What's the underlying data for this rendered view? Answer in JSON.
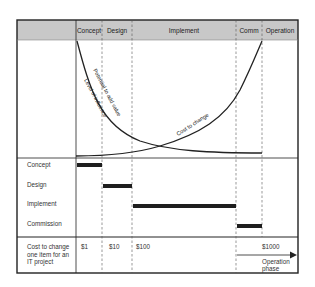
{
  "header": {
    "phases": [
      {
        "label": "Concept"
      },
      {
        "label": "Design"
      },
      {
        "label": "Implement"
      },
      {
        "label": "Comm"
      },
      {
        "label": "Operation"
      }
    ]
  },
  "curves": {
    "potential": "Potential to add value",
    "influence": "Level of influence",
    "cost": "Cost to change"
  },
  "gantt": {
    "rows": [
      {
        "label": "Concept"
      },
      {
        "label": "Design"
      },
      {
        "label": "Implement"
      },
      {
        "label": "Commission"
      }
    ]
  },
  "cost_row": {
    "label": "Cost to change one item for an IT project",
    "values": [
      "$1",
      "$10",
      "$100",
      "$1000"
    ],
    "operation_note": "Operation phase"
  },
  "colors": {
    "header_fill": "#c8c8c8",
    "line": "#222222",
    "bar": "#1e1e1e"
  }
}
